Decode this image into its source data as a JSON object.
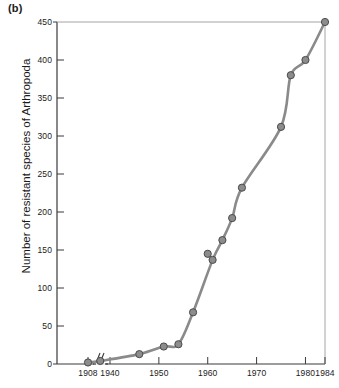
{
  "panel": {
    "label": "(b)"
  },
  "axes": {
    "ylabel": "Number of resistant species of Arthropoda",
    "xlabel": "",
    "y_ticks": [
      0,
      50,
      100,
      150,
      200,
      250,
      300,
      350,
      400,
      450
    ],
    "x_ticks": [
      1908,
      1940,
      1950,
      1960,
      1970,
      1980,
      1984
    ],
    "axis_break_after": 1908
  },
  "style": {
    "line_color": "#8a8a8a",
    "marker_fill": "#8c8c8c",
    "marker_stroke": "#4a4a4a",
    "axis_color": "#3a3a3a",
    "background": "#ffffff"
  },
  "chart_data": {
    "type": "line",
    "title": "",
    "xlabel": "",
    "ylabel": "Number of resistant species of Arthropoda",
    "xlim": [
      1904,
      1984
    ],
    "ylim": [
      0,
      450
    ],
    "grid": false,
    "legend": null,
    "axis_break": {
      "after_x": 1908,
      "note": "broken x-axis between 1908 and 1938"
    },
    "x": [
      1908,
      1938,
      1946,
      1951,
      1954,
      1957,
      1960,
      1961,
      1963,
      1965,
      1967,
      1975,
      1977,
      1980,
      1984
    ],
    "y": [
      2,
      4,
      13,
      23,
      26,
      68,
      145,
      137,
      163,
      192,
      232,
      312,
      380,
      400,
      450
    ],
    "series": [
      {
        "name": "Resistant arthropod species",
        "points": [
          {
            "x": 1908,
            "y": 2,
            "on_curve": true
          },
          {
            "x": 1938,
            "y": 4,
            "on_curve": true
          },
          {
            "x": 1946,
            "y": 13,
            "on_curve": true
          },
          {
            "x": 1951,
            "y": 23,
            "on_curve": true
          },
          {
            "x": 1954,
            "y": 26,
            "on_curve": true
          },
          {
            "x": 1957,
            "y": 68,
            "on_curve": true
          },
          {
            "x": 1960,
            "y": 145,
            "on_curve": false
          },
          {
            "x": 1961,
            "y": 137,
            "on_curve": true
          },
          {
            "x": 1963,
            "y": 163,
            "on_curve": true
          },
          {
            "x": 1965,
            "y": 192,
            "on_curve": true
          },
          {
            "x": 1967,
            "y": 232,
            "on_curve": true
          },
          {
            "x": 1975,
            "y": 312,
            "on_curve": true
          },
          {
            "x": 1977,
            "y": 380,
            "on_curve": true
          },
          {
            "x": 1980,
            "y": 400,
            "on_curve": true
          },
          {
            "x": 1984,
            "y": 450,
            "on_curve": true
          }
        ]
      }
    ]
  }
}
